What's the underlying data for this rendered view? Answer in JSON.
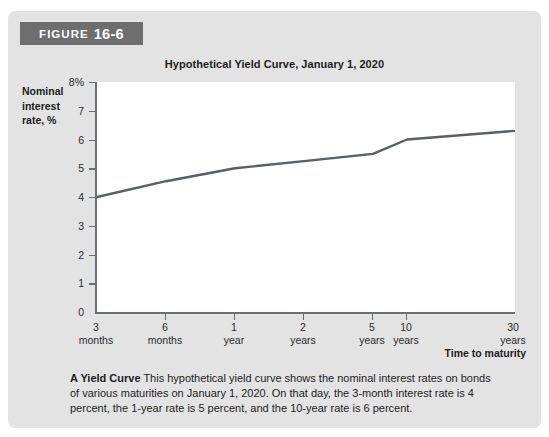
{
  "figure": {
    "badge_word": "FIGURE",
    "badge_number": "16-6",
    "title": "Hypothetical Yield Curve, January 1, 2020",
    "caption_lead": "A Yield Curve",
    "caption_body": "This hypothetical yield curve shows the nominal interest rates on bonds of various maturities on January 1, 2020. On that day, the 3-month interest rate is 4 percent, the 1-year rate is 5 percent, and the 10-year rate is 6 percent."
  },
  "colors": {
    "panel_background": "#e3e3e3",
    "badge_background": "#6e6e6e",
    "plot_background": "#ffffff",
    "axis": "#6a6f75",
    "curve": "#585f66",
    "text": "#1d1d1d"
  },
  "chart_data": {
    "type": "line",
    "title": "Hypothetical Yield Curve, January 1, 2020",
    "xlabel": "Time to maturity",
    "ylabel": "Nominal interest rate, %",
    "grid": false,
    "legend": "none",
    "ylim": [
      0,
      8
    ],
    "yticks": [
      0,
      1,
      2,
      3,
      4,
      5,
      6,
      7,
      8
    ],
    "ytick_labels": [
      "0",
      "1",
      "2",
      "3",
      "4",
      "5",
      "6",
      "7",
      "8%"
    ],
    "categories": [
      "3 months",
      "6 months",
      "1 year",
      "2 years",
      "5 years",
      "10 years",
      "30 years"
    ],
    "xtick_labels_line1": [
      "3",
      "6",
      "1",
      "2",
      "5",
      "10",
      "30"
    ],
    "xtick_labels_line2": [
      "months",
      "months",
      "year",
      "years",
      "years",
      "years",
      "years"
    ],
    "series": [
      {
        "name": "Nominal interest rate",
        "values": [
          4.0,
          4.55,
          5.0,
          5.25,
          5.5,
          6.0,
          6.3
        ]
      }
    ]
  }
}
